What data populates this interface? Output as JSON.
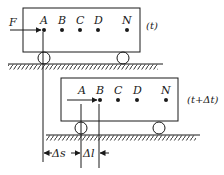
{
  "figure": {
    "type": "physics-diagram",
    "colors": {
      "ink": "#1a1a1a",
      "background": "#ffffff"
    }
  },
  "top_cart": {
    "time_label": "(t)",
    "force_label": "F",
    "points": [
      {
        "label": "A"
      },
      {
        "label": "B"
      },
      {
        "label": "C"
      },
      {
        "label": "D"
      },
      {
        "label": "N"
      }
    ]
  },
  "bottom_cart": {
    "time_label": "(t+Δt)",
    "points": [
      {
        "label": "A"
      },
      {
        "label": "B"
      },
      {
        "label": "C"
      },
      {
        "label": "D"
      },
      {
        "label": "N"
      }
    ]
  },
  "dimensions": {
    "displacement_label": "Δs",
    "compression_label": "Δl"
  }
}
